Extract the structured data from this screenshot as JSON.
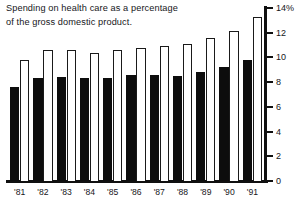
{
  "chart_data": {
    "type": "bar",
    "title": "Spending on health care as a percentage of the gross domestic product.",
    "title_lines": [
      "Spending on health care as a percentage",
      "of the gross domestic product."
    ],
    "xlabel": "",
    "ylabel": "",
    "ylim": [
      0,
      14
    ],
    "grid": false,
    "legend": "none",
    "categories": [
      "'81",
      "'82",
      "'83",
      "'84",
      "'85",
      "'86",
      "'87",
      "'88",
      "'89",
      "'90",
      "'91"
    ],
    "y_ticks": [
      0,
      2,
      4,
      6,
      8,
      10,
      12,
      14
    ],
    "y_tick_labels": [
      "0",
      "2",
      "4",
      "6",
      "8",
      "10",
      "12",
      "14%"
    ],
    "series": [
      {
        "name": "black-bar",
        "color": "#0d0d0d",
        "values": [
          7.6,
          8.3,
          8.4,
          8.3,
          8.3,
          8.6,
          8.6,
          8.5,
          8.8,
          9.2,
          9.8
        ]
      },
      {
        "name": "white-bar",
        "color": "#ffffff",
        "values": [
          9.8,
          10.6,
          10.6,
          10.4,
          10.6,
          10.8,
          10.9,
          11.1,
          11.6,
          12.1,
          13.3
        ]
      }
    ]
  }
}
